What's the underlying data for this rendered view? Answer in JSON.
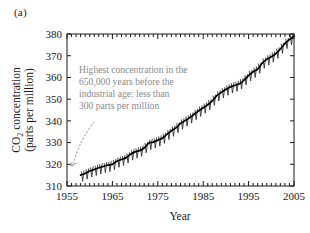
{
  "panel": {
    "label": "(a)"
  },
  "chart_data": {
    "type": "line",
    "title": "",
    "subtitle": "",
    "xlabel": "Year",
    "ylabel": "CO2 concentration (parts per million)",
    "ylabel_line1": "CO",
    "ylabel_line1_sub": "2",
    "ylabel_line1_rest": " concentration",
    "ylabel_line2": "(parts per million)",
    "xlim": [
      1955,
      2005
    ],
    "ylim": [
      310,
      380
    ],
    "xticks": [
      1955,
      1965,
      1975,
      1985,
      1995,
      2005
    ],
    "xtick_labels": [
      "1955",
      "1965",
      "1975",
      "1985",
      "1995",
      "2005"
    ],
    "xminor_tick_interval": 1,
    "yticks": [
      310,
      320,
      330,
      340,
      350,
      360,
      370,
      380
    ],
    "ytick_labels": [
      "310",
      "320",
      "330",
      "340",
      "350",
      "360",
      "370",
      "380"
    ],
    "grid": false,
    "legend": "none",
    "tick_direction": "in",
    "series": [
      {
        "name": "Monthly mean CO2 concentration (Mauna Loa)",
        "style": "sawtooth-seasonal",
        "seasonal_amplitude_ppm": 3.0,
        "x": [
          1958,
          1959,
          1960,
          1961,
          1962,
          1963,
          1964,
          1965,
          1966,
          1967,
          1968,
          1969,
          1970,
          1971,
          1972,
          1973,
          1974,
          1975,
          1976,
          1977,
          1978,
          1979,
          1980,
          1981,
          1982,
          1983,
          1984,
          1985,
          1986,
          1987,
          1988,
          1989,
          1990,
          1991,
          1992,
          1993,
          1994,
          1995,
          1996,
          1997,
          1998,
          1999,
          2000,
          2001,
          2002,
          2003,
          2004,
          2005
        ],
        "values": [
          315.0,
          315.8,
          316.9,
          317.6,
          318.4,
          319.0,
          319.6,
          320.0,
          321.4,
          322.2,
          323.0,
          324.6,
          325.7,
          326.3,
          327.5,
          329.7,
          330.2,
          331.1,
          332.0,
          333.8,
          335.4,
          336.8,
          338.7,
          340.1,
          341.4,
          343.0,
          344.6,
          346.0,
          347.4,
          349.2,
          351.6,
          353.1,
          354.4,
          355.6,
          356.4,
          357.1,
          358.8,
          360.8,
          362.6,
          363.8,
          366.6,
          368.3,
          369.5,
          371.0,
          373.1,
          375.6,
          377.4,
          379.0
        ]
      }
    ],
    "annotations": [
      {
        "name": "pre-industrial-note",
        "lines": [
          "Highest concentration in the",
          "650,000 years before the",
          "industrial age: less than",
          "300 parts per million"
        ],
        "color": "#8a8a8a",
        "leader": "dotted-curved-arrow",
        "leader_target_x": 1957,
        "leader_target_y": 314
      }
    ],
    "colors": {
      "axis": "#1a1a1a",
      "data_line": "#000000",
      "seasonal_spikes": "#333333",
      "annotation": "#8a8a8a",
      "background": "#ffffff"
    }
  }
}
